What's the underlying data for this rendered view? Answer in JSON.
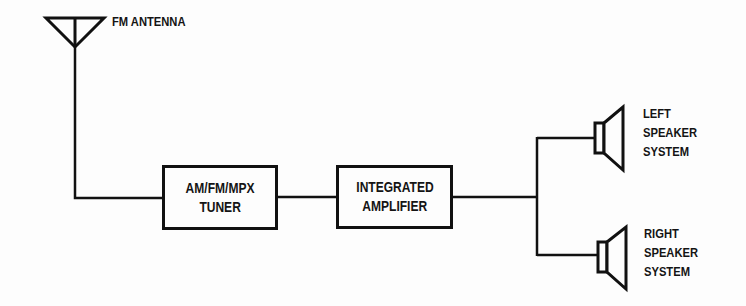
{
  "diagram": {
    "type": "block-diagram",
    "title": "",
    "colors": {
      "line": "#111111",
      "background": "#fdfdfd"
    },
    "antenna": {
      "label": "FM ANTENNA",
      "icon": "antenna-icon"
    },
    "blocks": [
      {
        "id": "tuner",
        "lines": [
          "AM/FM/MPX",
          "TUNER"
        ]
      },
      {
        "id": "amplifier",
        "lines": [
          "INTEGRATED",
          "AMPLIFIER"
        ]
      }
    ],
    "speakers": [
      {
        "id": "left",
        "icon": "speaker-icon",
        "lines": [
          "LEFT",
          "SPEAKER",
          "SYSTEM"
        ]
      },
      {
        "id": "right",
        "icon": "speaker-icon",
        "lines": [
          "RIGHT",
          "SPEAKER",
          "SYSTEM"
        ]
      }
    ],
    "connections": [
      [
        "antenna",
        "tuner"
      ],
      [
        "tuner",
        "amplifier"
      ],
      [
        "amplifier",
        "left"
      ],
      [
        "amplifier",
        "right"
      ]
    ]
  }
}
